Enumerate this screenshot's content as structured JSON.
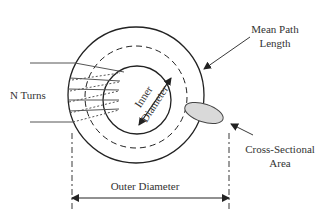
{
  "diagram": {
    "labels": {
      "n_turns": "N Turns",
      "inner_diameter_line1": "Inner",
      "inner_diameter_line2": "Diameter",
      "mean_path_line1": "Mean Path",
      "mean_path_line2": "Length",
      "cross_section_line1": "Cross-Sectional",
      "cross_section_line2": "Area",
      "outer_diameter": "Outer Diameter"
    },
    "colors": {
      "stroke": "#222222",
      "winding": "#555555",
      "cross_section_fill": "#d9d9d9",
      "text": "#333333"
    },
    "winding_count_drawn": 5
  }
}
